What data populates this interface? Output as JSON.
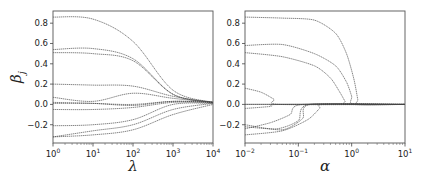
{
  "chart_data": [
    {
      "type": "line",
      "title": "",
      "xlabel": "λ",
      "ylabel": "β_j",
      "xscale": "log",
      "xlim": [
        1,
        10000
      ],
      "ylim": [
        -0.38,
        0.92
      ],
      "xticks": [
        1,
        10,
        100,
        1000,
        10000
      ],
      "xtick_labels": [
        [
          "10",
          "0"
        ],
        [
          "10",
          "1"
        ],
        [
          "10",
          "2"
        ],
        [
          "10",
          "3"
        ],
        [
          "10",
          "4"
        ]
      ],
      "yticks": [
        -0.2,
        0.0,
        0.2,
        0.4,
        0.6,
        0.8
      ],
      "ytick_labels": [
        "−0.2",
        "0.0",
        "0.2",
        "0.4",
        "0.6",
        "0.8"
      ],
      "grid": false,
      "legend": "none",
      "series": [
        {
          "name": "beta1",
          "x": [
            1,
            10,
            100,
            1000,
            10000
          ],
          "y": [
            0.86,
            0.84,
            0.62,
            0.14,
            0.02
          ]
        },
        {
          "name": "beta2",
          "x": [
            1,
            10,
            100,
            1000,
            10000
          ],
          "y": [
            0.54,
            0.55,
            0.45,
            0.1,
            0.02
          ]
        },
        {
          "name": "beta3",
          "x": [
            1,
            10,
            100,
            1000,
            10000
          ],
          "y": [
            0.51,
            0.5,
            0.43,
            0.1,
            0.02
          ]
        },
        {
          "name": "beta4",
          "x": [
            1,
            10,
            100,
            1000,
            10000
          ],
          "y": [
            0.2,
            0.19,
            0.18,
            0.08,
            0.02
          ]
        },
        {
          "name": "beta5",
          "x": [
            1,
            10,
            100,
            1000,
            10000
          ],
          "y": [
            0.07,
            0.03,
            0.11,
            0.06,
            0.02
          ]
        },
        {
          "name": "beta6",
          "x": [
            1,
            10,
            100,
            1000,
            10000
          ],
          "y": [
            0.02,
            0.01,
            0.0,
            0.03,
            0.02
          ]
        },
        {
          "name": "beta7",
          "x": [
            1,
            10,
            100,
            1000,
            10000
          ],
          "y": [
            0.01,
            0.01,
            -0.01,
            0.03,
            0.02
          ]
        },
        {
          "name": "beta8",
          "x": [
            1,
            10,
            100,
            1000,
            10000
          ],
          "y": [
            -0.05,
            -0.05,
            -0.03,
            0.02,
            0.02
          ]
        },
        {
          "name": "beta9",
          "x": [
            1,
            10,
            100,
            1000,
            10000
          ],
          "y": [
            -0.21,
            -0.2,
            -0.15,
            0.0,
            0.01
          ]
        },
        {
          "name": "beta10",
          "x": [
            1,
            10,
            100,
            1000,
            10000
          ],
          "y": [
            -0.32,
            -0.26,
            -0.2,
            -0.05,
            0.01
          ]
        },
        {
          "name": "beta11",
          "x": [
            1,
            10,
            100,
            1000,
            10000
          ],
          "y": [
            -0.32,
            -0.3,
            -0.25,
            -0.1,
            0.0
          ]
        }
      ]
    },
    {
      "type": "line",
      "title": "",
      "xlabel": "α",
      "ylabel": "",
      "xscale": "log",
      "xlim": [
        0.01,
        10
      ],
      "ylim": [
        -0.38,
        0.92
      ],
      "xticks": [
        0.01,
        0.1,
        1,
        10
      ],
      "xtick_labels": [
        [
          "10",
          "−2"
        ],
        [
          "10",
          "−1"
        ],
        [
          "10",
          "0"
        ],
        [
          "10",
          "1"
        ]
      ],
      "yticks": [
        -0.2,
        0.0,
        0.2,
        0.4,
        0.6,
        0.8
      ],
      "ytick_labels": [
        "−0.2",
        "0.0",
        "0.2",
        "0.4",
        "0.6",
        "0.8"
      ],
      "grid": false,
      "legend": "none",
      "series": [
        {
          "name": "beta1",
          "x": [
            0.01,
            0.05,
            0.2,
            0.5,
            0.8,
            1.1,
            1.3,
            1.35,
            10
          ],
          "y": [
            0.86,
            0.85,
            0.83,
            0.7,
            0.5,
            0.25,
            0.05,
            0.0,
            0.0
          ]
        },
        {
          "name": "beta2",
          "x": [
            0.01,
            0.05,
            0.2,
            0.5,
            0.8,
            1.0,
            1.1,
            10
          ],
          "y": [
            0.58,
            0.59,
            0.5,
            0.38,
            0.22,
            0.08,
            0.0,
            0.0
          ]
        },
        {
          "name": "beta3",
          "x": [
            0.01,
            0.05,
            0.2,
            0.4,
            0.6,
            0.75,
            0.8,
            10
          ],
          "y": [
            0.51,
            0.47,
            0.38,
            0.26,
            0.12,
            0.03,
            0.0,
            0.0
          ]
        },
        {
          "name": "beta4",
          "x": [
            0.01,
            0.02,
            0.035,
            0.045,
            10
          ],
          "y": [
            0.16,
            0.12,
            0.05,
            0.0,
            0.0
          ]
        },
        {
          "name": "beta5",
          "x": [
            0.01,
            0.045,
            10
          ],
          "y": [
            0.0,
            0.0,
            0.0
          ]
        },
        {
          "name": "beta6",
          "x": [
            0.01,
            0.03,
            0.045,
            10
          ],
          "y": [
            -0.04,
            -0.02,
            0.0,
            0.0
          ]
        },
        {
          "name": "beta7",
          "x": [
            0.01,
            0.03,
            0.07,
            0.12,
            10
          ],
          "y": [
            -0.24,
            -0.18,
            -0.1,
            0.0,
            0.0
          ]
        },
        {
          "name": "beta8",
          "x": [
            0.01,
            0.05,
            0.12,
            0.17,
            10
          ],
          "y": [
            -0.2,
            -0.25,
            -0.14,
            0.0,
            0.0
          ]
        },
        {
          "name": "beta9",
          "x": [
            0.01,
            0.04,
            0.1,
            0.16,
            10
          ],
          "y": [
            -0.22,
            -0.24,
            -0.16,
            0.0,
            0.0
          ]
        },
        {
          "name": "beta10",
          "x": [
            0.01,
            0.05,
            0.15,
            0.25,
            0.3,
            10
          ],
          "y": [
            -0.3,
            -0.26,
            -0.15,
            -0.04,
            0.0,
            0.0
          ]
        }
      ]
    }
  ]
}
